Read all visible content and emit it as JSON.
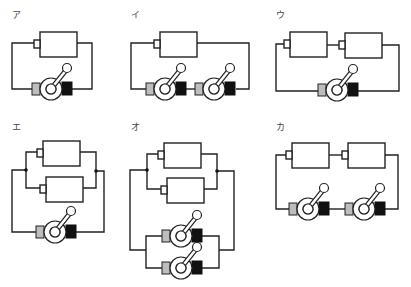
{
  "diagrams": [
    {
      "id": "a",
      "label": "ア",
      "description": "1 battery, 1 switch, series"
    },
    {
      "id": "i",
      "label": "イ",
      "description": "1 battery, 2 switches, series"
    },
    {
      "id": "u",
      "label": "ウ",
      "description": "2 batteries in series, 1 switch"
    },
    {
      "id": "e",
      "label": "エ",
      "description": "2 batteries in parallel, 1 switch"
    },
    {
      "id": "o",
      "label": "オ",
      "description": "2 batteries in parallel, 2 switches in parallel"
    },
    {
      "id": "ka",
      "label": "カ",
      "description": "2 batteries in series, 2 switches in series"
    }
  ],
  "colors": {
    "wire": "#222222",
    "switch_terminal_gray": "#bdbdbd",
    "switch_terminal_black": "#111111"
  }
}
